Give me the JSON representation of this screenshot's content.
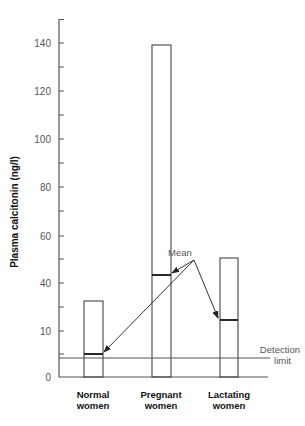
{
  "chart_data": {
    "type": "bar",
    "title": "",
    "xlabel": "",
    "ylabel": "Plasma calcitonin (ng/l)",
    "categories": [
      "Normal women",
      "Pregnant women",
      "Lactating women"
    ],
    "category_lines": [
      [
        "Normal",
        "women"
      ],
      [
        "Pregnant",
        "women"
      ],
      [
        "Lactating",
        "women"
      ]
    ],
    "series": [
      {
        "name": "Range maximum",
        "values": [
          32,
          139,
          51
        ]
      },
      {
        "name": "Mean",
        "values": [
          5,
          43,
          15
        ]
      }
    ],
    "y_ticks": [
      {
        "label": "0",
        "value": 0
      },
      {
        "label": "10",
        "value": 10
      },
      {
        "label": "40",
        "value": 40
      },
      {
        "label": "60",
        "value": 60
      },
      {
        "label": "80",
        "value": 80
      },
      {
        "label": "100",
        "value": 100
      },
      {
        "label": "120",
        "value": 120
      },
      {
        "label": "140",
        "value": 140
      }
    ],
    "ylim": [
      0,
      150
    ],
    "grid": false,
    "legend": null,
    "annotations": [
      {
        "text": "Mean",
        "points_to": [
          "Normal women mean",
          "Pregnant women mean",
          "Lactating women mean"
        ]
      },
      {
        "text": "Detection limit",
        "lines": [
          "Detection",
          "limit"
        ],
        "value": 4
      }
    ]
  },
  "colors": {
    "axis": "#555555",
    "bar_stroke": "#444444",
    "text": "#111111",
    "tick_text": "#555555"
  }
}
